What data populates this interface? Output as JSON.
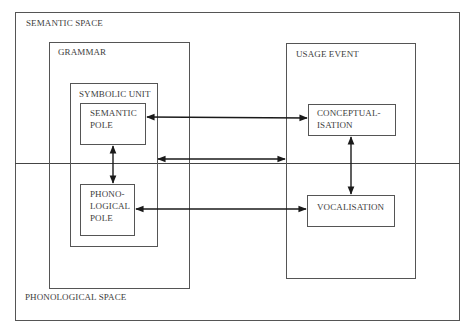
{
  "diagram": {
    "type": "nested-box-diagram",
    "spaces": {
      "semantic_space": "SEMANTIC SPACE",
      "phonological_space": "PHONOLOGICAL SPACE"
    },
    "grammar": {
      "title": "GRAMMAR",
      "symbolic_unit": {
        "title": "SYMBOLIC UNIT",
        "semantic_pole": "SEMANTIC\nPOLE",
        "phonological_pole": "PHONO-\nLOGICAL\nPOLE"
      }
    },
    "usage_event": {
      "title": "USAGE EVENT",
      "conceptualisation": "CONCEPTUAL-\nISATION",
      "vocalisation": "VOCALISATION"
    },
    "connections": [
      {
        "from": "semantic_pole",
        "to": "conceptualisation",
        "type": "bidirectional"
      },
      {
        "from": "symbolic_unit",
        "to": "usage_event",
        "type": "bidirectional"
      },
      {
        "from": "phonological_pole",
        "to": "vocalisation",
        "type": "bidirectional"
      },
      {
        "from": "semantic_pole",
        "to": "phonological_pole",
        "type": "bidirectional"
      },
      {
        "from": "conceptualisation",
        "to": "vocalisation",
        "type": "bidirectional"
      }
    ],
    "colors": {
      "line": "#555555",
      "arrow": "#1a1a1a",
      "text": "#3d3d3d",
      "background": "#ffffff"
    }
  }
}
